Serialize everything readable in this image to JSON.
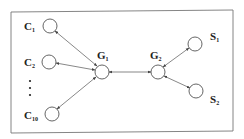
{
  "diagram": {
    "type": "network-topology",
    "frame": {
      "x": 11,
      "y": 12,
      "width": 222,
      "height": 120
    },
    "nodes": [
      {
        "id": "C1",
        "main": "C",
        "sub": "1",
        "cx": 50,
        "cy": 26,
        "lx": 24,
        "ly": 30
      },
      {
        "id": "C2",
        "main": "C",
        "sub": "2",
        "cx": 49,
        "cy": 62,
        "lx": 24,
        "ly": 66
      },
      {
        "id": "C10",
        "main": "C",
        "sub": "10",
        "cx": 52,
        "cy": 114,
        "lx": 24,
        "ly": 119
      },
      {
        "id": "G1",
        "main": "G",
        "sub": "1",
        "cx": 102,
        "cy": 72,
        "lx": 97,
        "ly": 58
      },
      {
        "id": "G2",
        "main": "G",
        "sub": "2",
        "cx": 158,
        "cy": 72,
        "lx": 150,
        "ly": 58
      },
      {
        "id": "S1",
        "main": "S",
        "sub": "1",
        "cx": 195,
        "cy": 44,
        "lx": 211,
        "ly": 39
      },
      {
        "id": "S2",
        "main": "S",
        "sub": "2",
        "cx": 196,
        "cy": 91,
        "lx": 211,
        "ly": 102
      }
    ],
    "edges": [
      {
        "from": "G1",
        "to": "C1",
        "bidirectional": true
      },
      {
        "from": "G1",
        "to": "C2",
        "bidirectional": true
      },
      {
        "from": "G1",
        "to": "C10",
        "bidirectional": true
      },
      {
        "from": "G1",
        "to": "G2",
        "bidirectional": true
      },
      {
        "from": "G2",
        "to": "S1",
        "bidirectional": true
      },
      {
        "from": "G2",
        "to": "S2",
        "bidirectional": true
      }
    ],
    "ellipsis": {
      "x": 30,
      "ys": [
        81,
        88,
        95
      ],
      "meaning": "clients C3 to C9 omitted"
    },
    "labels": {
      "C1": "C",
      "C1_sub": "1",
      "C2": "C",
      "C2_sub": "2",
      "C10": "C",
      "C10_sub": "10",
      "G1": "G",
      "G1_sub": "1",
      "G2": "G",
      "G2_sub": "2",
      "S1": "S",
      "S1_sub": "1",
      "S2": "S",
      "S2_sub": "2"
    }
  }
}
